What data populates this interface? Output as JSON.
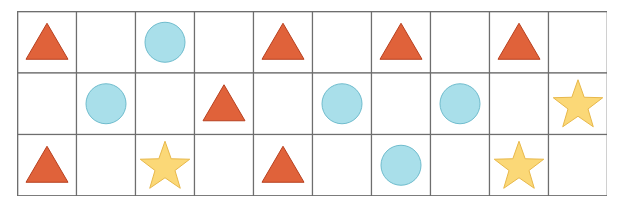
{
  "grid": {
    "rows": 3,
    "cols": 10,
    "cells": [
      [
        "triangle",
        "",
        "circle",
        "",
        "triangle",
        "",
        "triangle",
        "",
        "triangle",
        ""
      ],
      [
        "",
        "circle",
        "",
        "triangle",
        "",
        "circle",
        "",
        "circle",
        "",
        "star"
      ],
      [
        "triangle",
        "",
        "star",
        "",
        "triangle",
        "",
        "circle",
        "",
        "star",
        ""
      ]
    ]
  },
  "colors": {
    "triangle_fill": "#e0623a",
    "triangle_stroke": "#b8401f",
    "circle_fill": "#a9dfea",
    "circle_stroke": "#6fbccd",
    "star_fill": "#fbd877",
    "star_stroke": "#e8b84a",
    "grid_line": "#6e6e6e",
    "background": "#ffffff"
  }
}
